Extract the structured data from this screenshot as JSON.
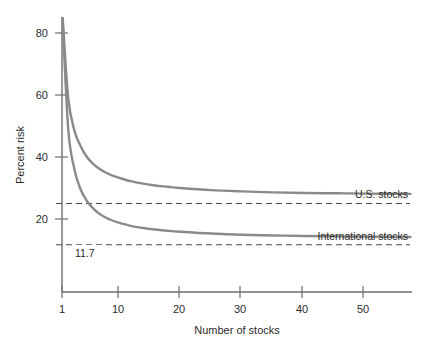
{
  "chart_data": {
    "type": "line",
    "title": "",
    "xlabel": "Number of stocks",
    "ylabel": "Percent risk",
    "xlim": [
      1,
      57
    ],
    "ylim": [
      0,
      88
    ],
    "xticks": [
      1,
      10,
      20,
      30,
      40,
      50
    ],
    "xtick_labels": [
      "1",
      "10",
      "20",
      "30",
      "40",
      "50"
    ],
    "yticks": [
      20,
      40,
      60,
      80
    ],
    "ytick_labels": [
      "20",
      "40",
      "60",
      "80"
    ],
    "grid": false,
    "legend_position": "inline-right",
    "series": [
      {
        "name": "U.S. stocks",
        "label": "U.S. stocks",
        "color": "#8a8a8a",
        "asymptote": 27.5,
        "x": [
          1,
          2,
          3,
          4,
          5,
          6,
          7,
          8,
          9,
          10,
          12,
          14,
          16,
          18,
          20,
          25,
          30,
          35,
          40,
          45,
          50,
          57
        ],
        "values": [
          88.0,
          59.0,
          48.5,
          43.5,
          40.0,
          37.8,
          36.2,
          35.0,
          34.1,
          33.4,
          32.2,
          31.4,
          30.8,
          30.4,
          30.0,
          29.3,
          28.9,
          28.6,
          28.4,
          28.3,
          28.2,
          28.1
        ]
      },
      {
        "name": "International stocks",
        "label": "International stocks",
        "color": "#8a8a8a",
        "asymptote": 13.5,
        "x": [
          1,
          2,
          3,
          4,
          5,
          6,
          7,
          8,
          9,
          10,
          12,
          14,
          16,
          18,
          20,
          25,
          30,
          35,
          40,
          45,
          50,
          57
        ],
        "values": [
          88.0,
          49.0,
          36.0,
          29.5,
          25.8,
          23.4,
          21.7,
          20.5,
          19.6,
          18.9,
          17.8,
          17.1,
          16.6,
          16.2,
          15.9,
          15.3,
          14.9,
          14.7,
          14.5,
          14.4,
          14.3,
          14.2
        ]
      }
    ],
    "annotations": [
      {
        "name": "us-asymptote-line",
        "type": "hline",
        "value": 25.0,
        "label": "",
        "style": "dashed"
      },
      {
        "name": "international-asymptote-line",
        "type": "hline",
        "value": 11.7,
        "label": "11.7",
        "style": "dashed"
      }
    ]
  },
  "axes": {
    "x_title": "Number of stocks",
    "y_title": "Percent risk"
  },
  "colors": {
    "curve": "#8a8a8a",
    "axis": "#6e6e6e",
    "text": "#2b2b2b",
    "dashed": "#4a4a4a",
    "background": "#ffffff"
  }
}
